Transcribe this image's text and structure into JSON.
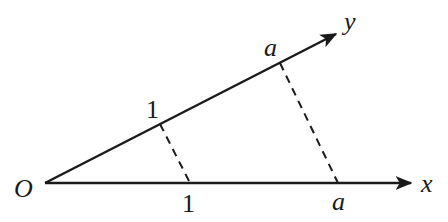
{
  "diagram": {
    "type": "oblique-axes",
    "origin": {
      "label": "O",
      "x": 45,
      "y": 183
    },
    "x_axis": {
      "label": "x",
      "tip": {
        "x": 413,
        "y": 183
      }
    },
    "y_axis": {
      "label": "y",
      "tip": {
        "x": 338,
        "y": 33
      }
    },
    "ticks": [
      {
        "axis": "y",
        "label": "1",
        "x": 160,
        "y": 124
      },
      {
        "axis": "x",
        "label": "1",
        "x": 190,
        "y": 183
      },
      {
        "axis": "y",
        "label": "a",
        "x": 280,
        "y": 63
      },
      {
        "axis": "x",
        "label": "a",
        "x": 338,
        "y": 183
      }
    ],
    "dashed_segments": [
      {
        "from": "y:1",
        "to": "x:1"
      },
      {
        "from": "y:a",
        "to": "x:a"
      }
    ],
    "color": "#1a1a1a"
  },
  "labels": {
    "origin": "O",
    "x": "x",
    "y": "y",
    "y_one": "1",
    "x_one": "1",
    "y_a": "a",
    "x_a": "a"
  }
}
